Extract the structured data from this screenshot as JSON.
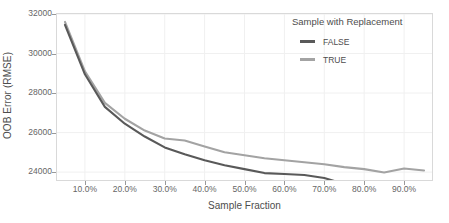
{
  "chart_data": {
    "type": "line",
    "title": "",
    "xlabel": "Sample Fraction",
    "ylabel": "OOB Error (RMSE)",
    "xlim": [
      0.03,
      0.97
    ],
    "ylim": [
      23600,
      32000
    ],
    "grid": true,
    "legend_position": "top-right-inside",
    "legend_title": "Sample with Replacement",
    "x_tick_labels": [
      "10.0%",
      "20.0%",
      "30.0%",
      "40.0%",
      "50.0%",
      "60.0%",
      "70.0%",
      "80.0%",
      "90.0%"
    ],
    "x_tick_values": [
      0.1,
      0.2,
      0.3,
      0.4,
      0.5,
      0.6,
      0.7,
      0.8,
      0.9
    ],
    "y_tick_labels": [
      "24000",
      "26000",
      "28000",
      "30000",
      "32000"
    ],
    "y_tick_values": [
      24000,
      26000,
      28000,
      30000,
      32000
    ],
    "x": [
      0.05,
      0.1,
      0.15,
      0.2,
      0.25,
      0.3,
      0.35,
      0.4,
      0.45,
      0.5,
      0.55,
      0.6,
      0.65,
      0.7,
      0.75,
      0.8,
      0.85,
      0.9,
      0.95
    ],
    "series": [
      {
        "name": "FALSE",
        "color": "#595959",
        "values": [
          31450,
          28950,
          27300,
          26450,
          25800,
          25250,
          24900,
          24600,
          24350,
          24150,
          23950,
          23900,
          23850,
          23700,
          23400,
          23400,
          23380,
          23450,
          23250
        ]
      },
      {
        "name": "TRUE",
        "color": "#a3a3a3",
        "values": [
          31600,
          29100,
          27500,
          26700,
          26100,
          25700,
          25600,
          25300,
          25000,
          24850,
          24700,
          24600,
          24500,
          24400,
          24250,
          24150,
          23980,
          24180,
          24080
        ]
      }
    ]
  },
  "legend": {
    "title": "Sample with Replacement",
    "entries": [
      {
        "label": "FALSE",
        "color": "#595959"
      },
      {
        "label": "TRUE",
        "color": "#a3a3a3"
      }
    ]
  },
  "axes": {
    "y_title": "OOB Error (RMSE)",
    "x_title": "Sample Fraction"
  },
  "colors": {
    "panel_border": "#d9d9d9",
    "gridline": "#f0f0f0",
    "tick_text": "#666666",
    "axis_text": "#4d4d4d",
    "background": "#ffffff"
  }
}
